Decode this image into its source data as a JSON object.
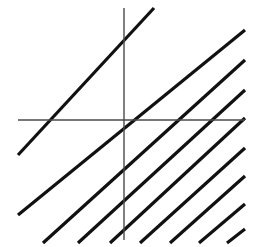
{
  "figure": {
    "type": "line-diagram",
    "canvas": {
      "width": 269,
      "height": 247,
      "background": "#ffffff"
    },
    "axes": {
      "color": "#4a4a4a",
      "stroke_width": 1.4,
      "origin": {
        "x": 124,
        "y": 120
      },
      "x_axis": {
        "label": "x-axis",
        "x1": 18,
        "y1": 120,
        "x2": 245,
        "y2": 120
      },
      "y_axis": {
        "label": "y-axis",
        "x1": 124,
        "y1": 8,
        "x2": 124,
        "y2": 240
      }
    },
    "lines": {
      "label": "parallel-line-family",
      "color": "#111111",
      "stroke_width": 3.2,
      "slope": 1,
      "count": 9,
      "spacing_px": 30,
      "segments": [
        {
          "name": "line-1",
          "x1": 18,
          "y1": 155,
          "x2": 154,
          "y2": 8
        },
        {
          "name": "line-2",
          "x1": 18,
          "y1": 215,
          "x2": 245,
          "y2": 30
        },
        {
          "name": "line-3",
          "x1": 43,
          "y1": 243,
          "x2": 245,
          "y2": 60
        },
        {
          "name": "line-4",
          "x1": 78,
          "y1": 243,
          "x2": 245,
          "y2": 90
        },
        {
          "name": "line-5",
          "x1": 110,
          "y1": 243,
          "x2": 245,
          "y2": 118
        },
        {
          "name": "line-6",
          "x1": 140,
          "y1": 243,
          "x2": 245,
          "y2": 148
        },
        {
          "name": "line-7",
          "x1": 170,
          "y1": 243,
          "x2": 245,
          "y2": 176
        },
        {
          "name": "line-8",
          "x1": 199,
          "y1": 243,
          "x2": 245,
          "y2": 204
        },
        {
          "name": "line-9",
          "x1": 227,
          "y1": 243,
          "x2": 245,
          "y2": 229
        }
      ]
    }
  },
  "chart_data": {
    "type": "line",
    "xlabel": "",
    "ylabel": "",
    "xlim": [
      18,
      245
    ],
    "ylim": [
      8,
      243
    ],
    "grid": false,
    "legend": "none",
    "annotations": [],
    "series": [
      {
        "name": "line-1",
        "x": [
          18,
          154
        ],
        "y": [
          155,
          8
        ]
      },
      {
        "name": "line-2",
        "x": [
          18,
          245
        ],
        "y": [
          215,
          30
        ]
      },
      {
        "name": "line-3",
        "x": [
          43,
          245
        ],
        "y": [
          243,
          60
        ]
      },
      {
        "name": "line-4",
        "x": [
          78,
          245
        ],
        "y": [
          243,
          90
        ]
      },
      {
        "name": "line-5",
        "x": [
          110,
          245
        ],
        "y": [
          243,
          118
        ]
      },
      {
        "name": "line-6",
        "x": [
          140,
          245
        ],
        "y": [
          243,
          148
        ]
      },
      {
        "name": "line-7",
        "x": [
          170,
          245
        ],
        "y": [
          243,
          176
        ]
      },
      {
        "name": "line-8",
        "x": [
          199,
          245
        ],
        "y": [
          243,
          204
        ]
      },
      {
        "name": "line-9",
        "x": [
          227,
          245
        ],
        "y": [
          243,
          229
        ]
      },
      {
        "name": "x-axis",
        "x": [
          18,
          245
        ],
        "y": [
          120,
          120
        ]
      },
      {
        "name": "y-axis",
        "x": [
          124,
          124
        ],
        "y": [
          8,
          240
        ]
      }
    ]
  }
}
